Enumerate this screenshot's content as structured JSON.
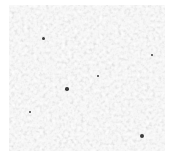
{
  "image": {
    "description": "Grayscale speckled noise texture on white background",
    "width": 171,
    "height": 157,
    "texture_bounds": {
      "x": 9,
      "y": 5,
      "width": 156,
      "height": 146
    },
    "colors": {
      "background": "#ffffff",
      "light": "#f2f2f2",
      "mid": "#c8c8c8",
      "dark": "#3a3a3a"
    },
    "dark_specks": [
      {
        "x": 43,
        "y": 38,
        "r": 1.5
      },
      {
        "x": 67,
        "y": 89,
        "r": 1.8
      },
      {
        "x": 98,
        "y": 76,
        "r": 1.2
      },
      {
        "x": 142,
        "y": 136,
        "r": 2.0
      },
      {
        "x": 152,
        "y": 55,
        "r": 1.3
      },
      {
        "x": 30,
        "y": 112,
        "r": 1.2
      }
    ]
  }
}
